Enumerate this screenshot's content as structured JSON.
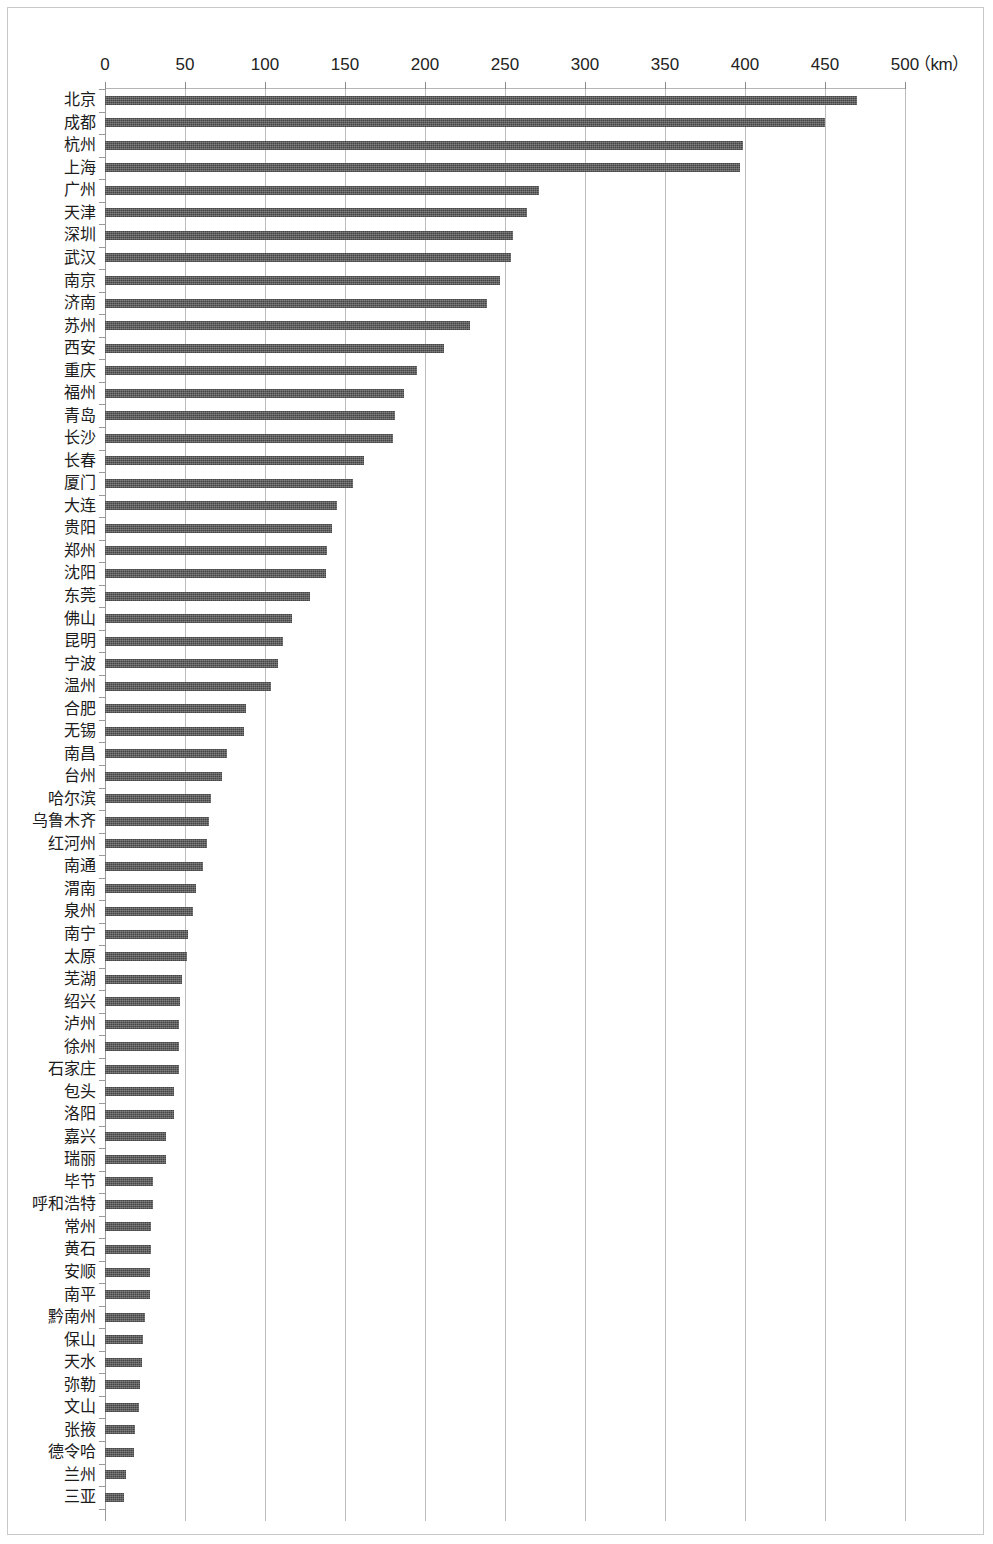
{
  "chart_data": {
    "type": "bar",
    "orientation": "horizontal",
    "title": "",
    "subtitle": "",
    "xlabel": "（km）",
    "ylabel": "",
    "xlim": [
      0,
      500
    ],
    "xticks": [
      0,
      50,
      100,
      150,
      200,
      250,
      300,
      350,
      400,
      450,
      500
    ],
    "xtick_labels": [
      "0",
      "50",
      "100",
      "150",
      "200",
      "250",
      "300",
      "350",
      "400",
      "450",
      "500"
    ],
    "unit_label": "（km）",
    "grid": true,
    "grid_axis": "x",
    "legend": null,
    "legend_position": "none",
    "bar_color": "#585858",
    "categories": [
      "北京",
      "成都",
      "杭州",
      "上海",
      "广州",
      "天津",
      "深圳",
      "武汉",
      "南京",
      "济南",
      "苏州",
      "西安",
      "重庆",
      "福州",
      "青岛",
      "长沙",
      "长春",
      "厦门",
      "大连",
      "贵阳",
      "郑州",
      "沈阳",
      "东莞",
      "佛山",
      "昆明",
      "宁波",
      "温州",
      "合肥",
      "无锡",
      "南昌",
      "台州",
      "哈尔滨",
      "乌鲁木齐",
      "红河州",
      "南通",
      "渭南",
      "泉州",
      "南宁",
      "太原",
      "芜湖",
      "绍兴",
      "泸州",
      "徐州",
      "石家庄",
      "包头",
      "洛阳",
      "嘉兴",
      "瑞丽",
      "毕节",
      "呼和浩特",
      "常州",
      "黄石",
      "安顺",
      "南平",
      "黔南州",
      "保山",
      "天水",
      "弥勒",
      "文山",
      "张掖",
      "德令哈",
      "兰州",
      "三亚"
    ],
    "values": [
      470,
      450,
      399,
      397,
      271,
      264,
      255,
      254,
      247,
      239,
      228,
      212,
      195,
      187,
      181,
      180,
      162,
      155,
      145,
      142,
      139,
      138,
      128,
      117,
      111,
      108,
      104,
      88,
      87,
      76,
      73,
      66,
      65,
      64,
      61,
      57,
      55,
      52,
      51,
      48,
      47,
      46,
      46,
      46,
      43,
      43,
      38,
      38,
      30,
      30,
      29,
      29,
      28,
      28,
      25,
      24,
      23,
      22,
      21,
      19,
      18,
      13,
      12
    ]
  }
}
